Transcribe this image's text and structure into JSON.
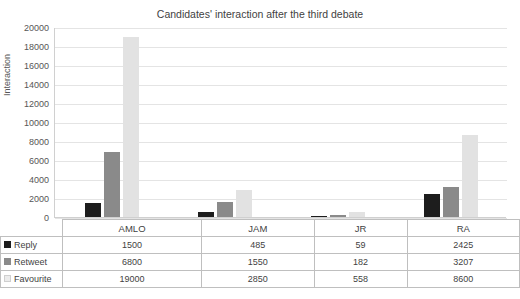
{
  "chart_data": {
    "type": "bar",
    "title": "Candidates' interaction after the third debate",
    "xlabel": "",
    "ylabel": "Interaction",
    "categories": [
      "AMLO",
      "JAM",
      "JR",
      "RA"
    ],
    "series": [
      {
        "name": "Reply",
        "color": "#1d1d1d",
        "values": [
          1500,
          485,
          59,
          2425
        ]
      },
      {
        "name": "Retweet",
        "color": "#8a8a8a",
        "values": [
          6800,
          1550,
          182,
          3207
        ]
      },
      {
        "name": "Favourite",
        "color": "#e2e2e2",
        "values": [
          19000,
          2850,
          558,
          8600
        ]
      }
    ],
    "ylim": [
      0,
      20000
    ],
    "yticks": [
      "0",
      "2000",
      "4000",
      "6000",
      "8000",
      "10000",
      "12000",
      "14000",
      "16000",
      "18000",
      "20000"
    ],
    "grid": true,
    "legend_position": "table-left"
  },
  "table": {
    "row_labels": [
      "Reply",
      "Retweet",
      "Favourite"
    ],
    "column_labels": [
      "AMLO",
      "JAM",
      "JR",
      "RA"
    ],
    "rows": [
      [
        "1500",
        "485",
        "59",
        "2425"
      ],
      [
        "6800",
        "1550",
        "182",
        "3207"
      ],
      [
        "19000",
        "2850",
        "558",
        "8600"
      ]
    ]
  }
}
